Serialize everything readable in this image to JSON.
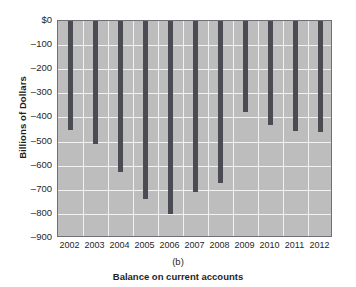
{
  "chart_data": {
    "type": "bar",
    "title": "",
    "subtitle": "",
    "panel_letter": "(b)",
    "caption": "Balance on current accounts",
    "xlabel": "",
    "ylabel": "Billions of Dollars",
    "categories": [
      "2002",
      "2003",
      "2004",
      "2005",
      "2006",
      "2007",
      "2008",
      "2009",
      "2010",
      "2011",
      "2012"
    ],
    "values": [
      -450,
      -512,
      -625,
      -740,
      -800,
      -710,
      -670,
      -376,
      -432,
      -458,
      -462
    ],
    "ylim": [
      -900,
      0
    ],
    "ytick_values": [
      0,
      -100,
      -200,
      -300,
      -400,
      -500,
      -600,
      -700,
      -800,
      -900
    ],
    "ytick_labels": [
      "$0",
      "–100",
      "–200",
      "–300",
      "–400",
      "–500",
      "–600",
      "–700",
      "–800",
      "–900"
    ],
    "grid": true,
    "legend": "none",
    "bar_color": "#4b4b53",
    "panel_color": "#bdbdbd",
    "gridline_color": "#f2f2f2",
    "axis_border_color": "#6f6f77"
  }
}
